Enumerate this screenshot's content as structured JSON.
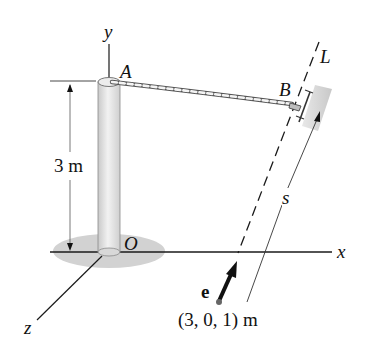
{
  "diagram": {
    "type": "3d-mechanics-figure",
    "axes": {
      "x_label": "x",
      "y_label": "y",
      "z_label": "z"
    },
    "points": {
      "A": "A",
      "B": "B",
      "O": "O"
    },
    "line_label": "L",
    "distance_label": "s",
    "unit_vector_label": "e",
    "height_dimension": "3 m",
    "start_point_label": "(3, 0, 1) m",
    "colors": {
      "line": "#1a1a1a",
      "pole_fill": "#e6e6e6",
      "pole_shade": "#c8c8c8",
      "ground_shadow": "#cfcfcf",
      "slider_fill": "#d4d4d4",
      "dimension_line": "#555555"
    }
  }
}
